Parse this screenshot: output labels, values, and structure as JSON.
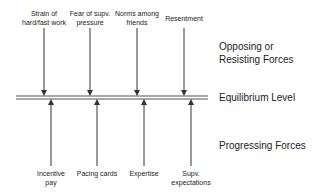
{
  "diagram": {
    "equilibrium_label": "Equilibrium Level",
    "opposing_label": "Opposing or\nResisting Forces",
    "progressing_label": "Progressing Forces",
    "opposing_forces": [
      {
        "label": "Strain of\nhard/fast work"
      },
      {
        "label": "Fear of supv.\npressure"
      },
      {
        "label": "Norms among\nfriends"
      },
      {
        "label": "Resentment"
      }
    ],
    "progressing_forces": [
      {
        "label": "Incentive\npay"
      },
      {
        "label": "Pacing cards"
      },
      {
        "label": "Expertise"
      },
      {
        "label": "Supv.\nexpectations"
      }
    ],
    "colors": {
      "line": "#333333",
      "equilibrium_line": "#555555",
      "text": "#222222"
    }
  }
}
